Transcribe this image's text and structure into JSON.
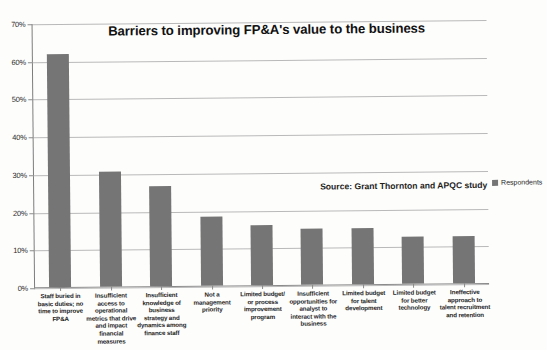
{
  "chart_data": {
    "type": "bar",
    "title": "Barriers to improving FP&A's value to the business",
    "xlabel": "",
    "ylabel": "",
    "ylim": [
      0,
      70
    ],
    "ytick_labels": [
      "0%",
      "10%",
      "20%",
      "30%",
      "40%",
      "50%",
      "60%",
      "70%"
    ],
    "ytick_values": [
      0,
      10,
      20,
      30,
      40,
      50,
      60,
      70
    ],
    "grid": true,
    "legend_position": "right",
    "categories": [
      "Staff buried in basic duties; no time to improve FP&A",
      "Insufficient access to operational metrics that drive and impact financial measures",
      "Insufficient knowledge of business strategy and dynamics among finance staff",
      "Not a management priority",
      "Limited budget/ or process improvement program",
      "Insufficient opportunities for analyst to interact with the business",
      "Limited budget for talent development",
      "Limited budget for better technology",
      "Ineffective approach to talent recruitment and retention"
    ],
    "series": [
      {
        "name": "Respondents",
        "color": "#757575",
        "values": [
          62,
          30.5,
          26.5,
          18.5,
          16,
          15,
          14.8,
          12.6,
          12.4
        ]
      }
    ],
    "annotations": [
      "Source: Grant Thornton and APQC study"
    ]
  },
  "legend": {
    "entries": [
      {
        "label": "Respondents",
        "color": "#757575"
      }
    ]
  },
  "source_note": "Source: Grant Thornton and APQC study"
}
